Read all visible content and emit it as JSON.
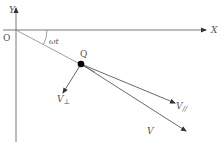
{
  "diagram": {
    "axes": {
      "x_label": "X",
      "y_label": "Y",
      "origin_label": "O"
    },
    "angle_label": "ωt",
    "point_label": "Q",
    "vectors": [
      {
        "name": "v-perp",
        "label": "V",
        "subscript": "⊥"
      },
      {
        "name": "v-parallel",
        "label": "V",
        "subscript": "//"
      },
      {
        "name": "v",
        "label": "V",
        "subscript": ""
      }
    ],
    "colors": {
      "line": "#444444",
      "light_line": "#888888",
      "point": "#000000",
      "text": "#555555"
    }
  }
}
